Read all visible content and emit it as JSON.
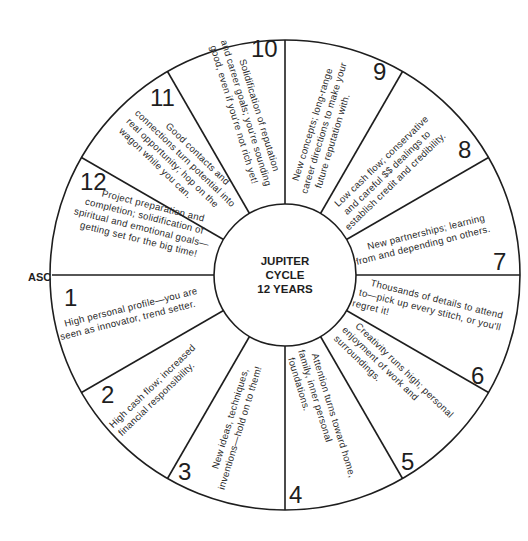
{
  "diagram": {
    "center": {
      "lines": [
        "JUPITER",
        "CYCLE",
        "12 YEARS"
      ]
    },
    "asc_label": "ASC",
    "houses": [
      {
        "number": "1",
        "lines": [
          "High personal profile—you are",
          "seen as innovator, trend setter."
        ]
      },
      {
        "number": "2",
        "lines": [
          "High cash flow; increased",
          "financial responsibility."
        ]
      },
      {
        "number": "3",
        "lines": [
          "New ideas, techniques,",
          "inventions—hold on to them!"
        ]
      },
      {
        "number": "4",
        "lines": [
          "Attention turns toward home,",
          "family, inner personal",
          "foundations."
        ]
      },
      {
        "number": "5",
        "lines": [
          "Creativity runs high; personal",
          "enjoyment of work and",
          "surroundings."
        ]
      },
      {
        "number": "6",
        "lines": [
          "Thousands of details to attend",
          "to—pick up every stitch, or you'll",
          "regret it!"
        ]
      },
      {
        "number": "7",
        "lines": [
          "New partnerships; learning",
          "from and depending on others."
        ]
      },
      {
        "number": "8",
        "lines": [
          "Low cash flow; conservative",
          "and careful $$ dealings to",
          "establish credit and credibility."
        ]
      },
      {
        "number": "9",
        "lines": [
          "New concepts; long-range",
          "career directions to make your",
          "future reputation with."
        ]
      },
      {
        "number": "10",
        "lines": [
          "Solidification of reputation",
          "and career goals; you're sounding",
          "good, even if you're not rich yet!"
        ]
      },
      {
        "number": "11",
        "lines": [
          "Good contacts and",
          "connections turn potential into",
          "real opportunity; hop on the",
          "wagon while you can."
        ]
      },
      {
        "number": "12",
        "lines": [
          "Project preparation and",
          "completion; solidification of",
          "spiritual and emotional goals—",
          "getting set for the big time!"
        ]
      }
    ],
    "colors": {
      "line": "#1e1e1e",
      "text": "#2a2a2a",
      "background": "#ffffff"
    }
  }
}
